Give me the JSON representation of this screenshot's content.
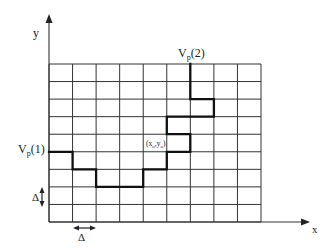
{
  "diagram": {
    "axes": {
      "x_label": "x",
      "y_label": "y"
    },
    "grid": {
      "columns": 9,
      "rows": 9
    },
    "labels": {
      "start_point": {
        "base": "V",
        "sub": "p",
        "tail": "(1)"
      },
      "end_point": {
        "base": "V",
        "sub": "p",
        "tail": "(2)"
      },
      "origin_point": {
        "open": "(",
        "x": "x",
        "x_sub": "o",
        "sep": ",",
        "y": "y",
        "y_sub": "o",
        "close": ")"
      },
      "delta_vertical": "Δ",
      "delta_horizontal": "Δ"
    },
    "path_cells": [
      [
        0,
        5
      ],
      [
        1,
        5
      ],
      [
        1,
        6
      ],
      [
        2,
        6
      ],
      [
        2,
        7
      ],
      [
        4,
        7
      ],
      [
        4,
        6
      ],
      [
        5,
        6
      ],
      [
        5,
        5
      ],
      [
        6,
        5
      ],
      [
        6,
        4
      ],
      [
        5,
        4
      ],
      [
        5,
        3
      ],
      [
        7,
        3
      ],
      [
        7,
        2
      ],
      [
        6,
        2
      ],
      [
        6,
        0
      ]
    ],
    "colors": {
      "lines": "#333333",
      "path": "#111111",
      "text": "#222222"
    }
  }
}
